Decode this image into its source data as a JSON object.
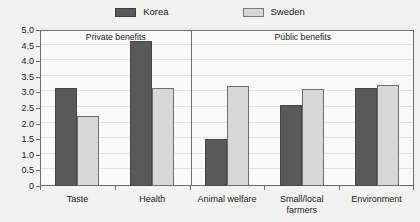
{
  "chart_data": {
    "type": "bar",
    "title": "",
    "xlabel": "",
    "ylabel": "",
    "ylim": [
      0,
      5.0
    ],
    "ytick_labels": [
      "0",
      "0.5",
      "1.0",
      "1.5",
      "2.0",
      "2.5",
      "3.0",
      "3.5",
      "4.0",
      "4.5",
      "5.0"
    ],
    "ytick_values": [
      0,
      0.5,
      1.0,
      1.5,
      2.0,
      2.5,
      3.0,
      3.5,
      4.0,
      4.5,
      5.0
    ],
    "grid": true,
    "legend_position": "top-center",
    "categories": [
      "Taste",
      "Health",
      "Animal welfare",
      "Small/local\nfarmers",
      "Environment"
    ],
    "series": [
      {
        "name": "Korea",
        "color": "#595959",
        "values": [
          3.15,
          4.65,
          1.5,
          2.6,
          3.15
        ]
      },
      {
        "name": "Sweden",
        "color": "#d7d7d5",
        "values": [
          2.25,
          3.15,
          3.2,
          3.1,
          3.25
        ]
      }
    ],
    "sections": [
      {
        "label": "Private benefits",
        "categories": [
          "Taste",
          "Health"
        ]
      },
      {
        "label": "Public benefits",
        "categories": [
          "Animal welfare",
          "Small/local\nfarmers",
          "Environment"
        ]
      }
    ],
    "section_divider_after_category_index": 1
  },
  "legend": {
    "entries": [
      {
        "label": "Korea",
        "swatch": "korea-swatch"
      },
      {
        "label": "Sweden",
        "swatch": "sweden-swatch"
      }
    ]
  },
  "colors": {
    "korea": "#595959",
    "sweden": "#d7d7d5",
    "axis": "#6e6e6e",
    "grid": "#e4e4e2",
    "background": "#f2f2f0",
    "plot_background": "#fafaf8",
    "text": "#1a1a1a"
  }
}
